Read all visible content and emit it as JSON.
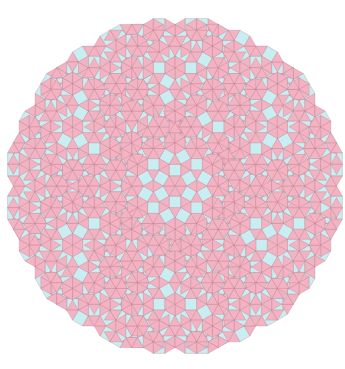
{
  "caption": {
    "text": "▬ ·········· ·· ·········"
  },
  "figure": {
    "center": [
      175,
      186
    ],
    "edge": 11.6,
    "clip_radius": 176,
    "colors": {
      "square": "#c9eef1",
      "triangle": "#f4b3c2",
      "stroke": "#b07a88",
      "background": "#ffffff"
    },
    "levels": 2
  }
}
